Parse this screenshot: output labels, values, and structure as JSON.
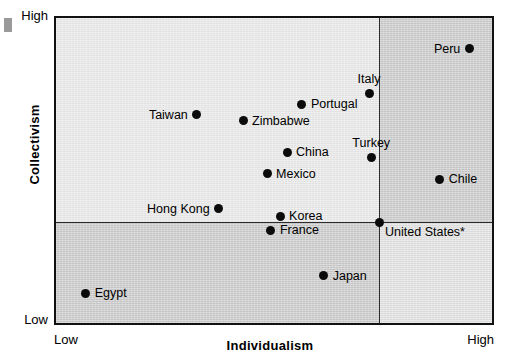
{
  "chart_data": {
    "type": "scatter",
    "title": "",
    "xlabel": "Individualism",
    "ylabel": "Collectivism",
    "x_tick_labels": [
      "Low",
      "High"
    ],
    "y_tick_labels": [
      "High",
      "Low"
    ],
    "xlim": [
      0,
      100
    ],
    "ylim": [
      0,
      100
    ],
    "grid": false,
    "legend": "none",
    "quadrant_divider_x": 74.1,
    "quadrant_divider_y": 67.0,
    "annotations": [
      "United States* marks the origin of the two axes"
    ],
    "points": [
      {
        "label": "Peru",
        "x": 94.8,
        "y": 90.0,
        "label_pos": "left"
      },
      {
        "label": "Italy",
        "x": 71.8,
        "y": 75.4,
        "label_pos": "above"
      },
      {
        "label": "Portugal",
        "x": 56.4,
        "y": 71.8,
        "label_pos": "right"
      },
      {
        "label": "Taiwan",
        "x": 32.3,
        "y": 68.3,
        "label_pos": "left"
      },
      {
        "label": "Zimbabwe",
        "x": 42.9,
        "y": 66.3,
        "label_pos": "right"
      },
      {
        "label": "Turkey",
        "x": 72.3,
        "y": 54.4,
        "label_pos": "above"
      },
      {
        "label": "China",
        "x": 53.0,
        "y": 56.0,
        "label_pos": "right"
      },
      {
        "label": "Mexico",
        "x": 48.4,
        "y": 48.9,
        "label_pos": "right"
      },
      {
        "label": "Chile",
        "x": 88.0,
        "y": 47.2,
        "label_pos": "right"
      },
      {
        "label": "Hong Kong",
        "x": 37.3,
        "y": 37.5,
        "label_pos": "left"
      },
      {
        "label": "Korea",
        "x": 51.4,
        "y": 35.0,
        "label_pos": "right"
      },
      {
        "label": "France",
        "x": 49.3,
        "y": 30.4,
        "label_pos": "right"
      },
      {
        "label": "United States*",
        "x": 74.1,
        "y": 33.0,
        "label_pos": "belowright"
      },
      {
        "label": "Japan",
        "x": 61.4,
        "y": 15.5,
        "label_pos": "right"
      },
      {
        "label": "Egypt",
        "x": 6.8,
        "y": 9.7,
        "label_pos": "right"
      }
    ]
  }
}
